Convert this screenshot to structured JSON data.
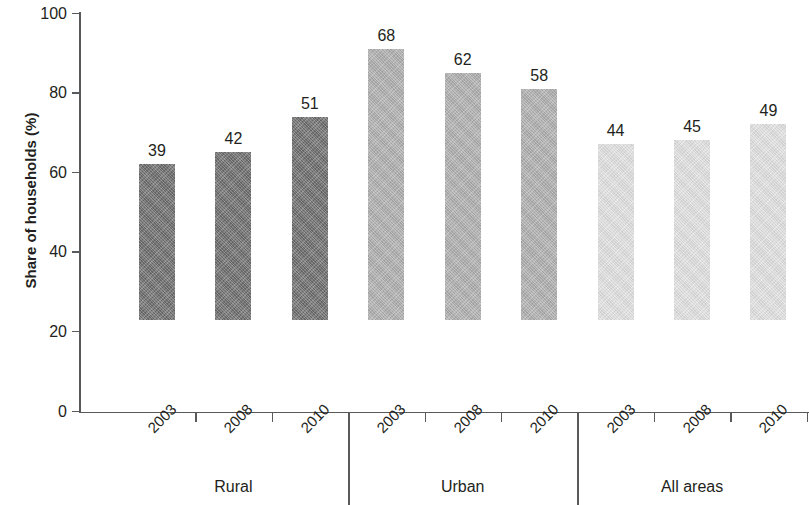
{
  "chart_data": {
    "type": "bar",
    "title": "",
    "subtitle": "",
    "xlabel": "",
    "ylabel": "Share of households (%)",
    "ylim": [
      0,
      100
    ],
    "ytick_labels": [
      "0",
      "20",
      "40",
      "60",
      "80",
      "100"
    ],
    "ytick_values": [
      0,
      20,
      40,
      60,
      80,
      100
    ],
    "grid": false,
    "legend": "none",
    "categories": [
      "2003",
      "2008",
      "2010"
    ],
    "groups": [
      {
        "name": "Rural",
        "color": "#6e6e6e",
        "bars": [
          {
            "category": "2003",
            "value": 39,
            "label": "39"
          },
          {
            "category": "2008",
            "value": 42,
            "label": "42"
          },
          {
            "category": "2010",
            "value": 51,
            "label": "51"
          }
        ]
      },
      {
        "name": "Urban",
        "color": "#b0b0b0",
        "bars": [
          {
            "category": "2003",
            "value": 68,
            "label": "68"
          },
          {
            "category": "2008",
            "value": 62,
            "label": "62"
          },
          {
            "category": "2010",
            "value": 58,
            "label": "58"
          }
        ]
      },
      {
        "name": "All areas",
        "color": "#e2e2e2",
        "bars": [
          {
            "category": "2003",
            "value": 44,
            "label": "44"
          },
          {
            "category": "2008",
            "value": 45,
            "label": "45"
          },
          {
            "category": "2010",
            "value": 49,
            "label": "49"
          }
        ]
      }
    ],
    "series": [
      {
        "name": "Rural",
        "values": [
          39,
          42,
          51
        ]
      },
      {
        "name": "Urban",
        "values": [
          68,
          62,
          58
        ]
      },
      {
        "name": "All areas",
        "values": [
          44,
          45,
          49
        ]
      }
    ],
    "axis_color": "#58595b",
    "text_color": "#231f20",
    "background": "#ffffff"
  }
}
